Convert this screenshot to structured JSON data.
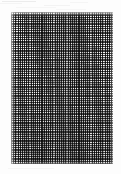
{
  "figure": {
    "kind": "woven-mesh-fabric-micrograph",
    "background_color": "#fdfdfd",
    "canvas": {
      "width_px": 121,
      "height_px": 174
    },
    "alt_text": "Grayscale micrograph of a plain-weave mesh fabric swatch on a white background"
  },
  "specimen": {
    "name": "woven-mesh-swatch",
    "description": "Plain-weave textile mesh, orthogonal warp and weft threads forming a fine checkerboard",
    "bounds_px": {
      "left": 11,
      "top": 12,
      "width": 102,
      "height": 152
    },
    "weave": {
      "pattern": "plain-weave",
      "thread_pitch_px": 1.85,
      "thread_width_px": 0.9,
      "warp_direction": "vertical",
      "weft_direction": "horizontal",
      "approx_columns": 55,
      "approx_rows": 82
    },
    "colors": {
      "thread_dark": "#282828",
      "thread_light": "#fafafa",
      "mid_tone": "#c9c9c9",
      "mount_white": "#ffffff"
    },
    "tone": {
      "upper_region": "lighter, more open weave",
      "lower_region": "denser, darker weave"
    }
  },
  "artifacts": {
    "name": "scan-noise",
    "description": "Faint horizontal scanner streaks in the upper white margin",
    "streak_color": "#ececec",
    "streak_count": 7
  }
}
